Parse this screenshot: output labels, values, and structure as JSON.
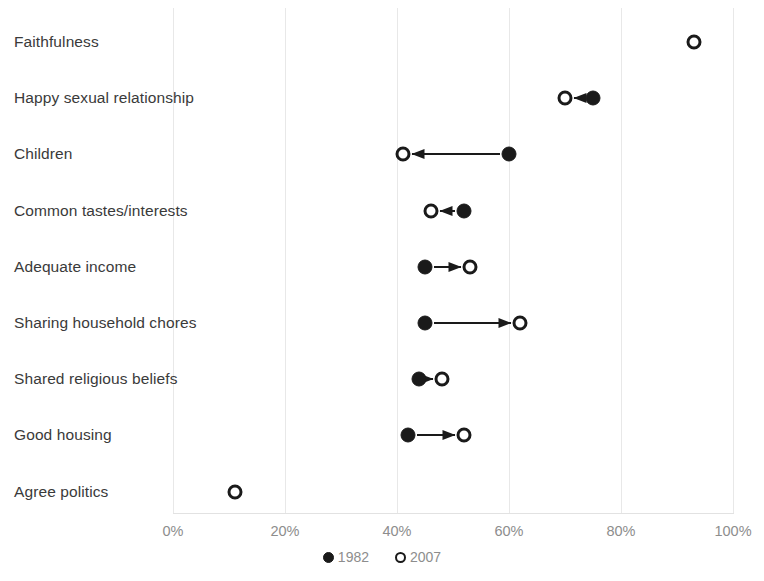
{
  "chart_data": {
    "type": "scatter",
    "title": "",
    "subtitle": "",
    "xlabel": "",
    "ylabel": "",
    "xlim": [
      0,
      100
    ],
    "grid": true,
    "grid_axis": "x",
    "legend_position": "bottom-center",
    "tick_labels": [
      "0%",
      "20%",
      "40%",
      "60%",
      "80%",
      "100%"
    ],
    "tick_values": [
      0,
      20,
      40,
      60,
      80,
      100
    ],
    "legend": [
      {
        "name": "1982",
        "marker": "filled-circle"
      },
      {
        "name": "2007",
        "marker": "open-circle"
      }
    ],
    "series": [
      {
        "name": "1982",
        "marker": "filled-circle",
        "values": [
          93,
          75,
          60,
          52,
          45,
          45,
          44,
          42,
          null
        ]
      },
      {
        "name": "2007",
        "marker": "open-circle",
        "values": [
          93,
          70,
          41,
          46,
          53,
          62,
          48,
          52,
          11
        ]
      }
    ],
    "categories": [
      "Faithfulness",
      "Happy sexual relationship",
      "Children",
      "Common tastes/interests",
      "Adequate income",
      "Sharing household chores",
      "Shared religious beliefs",
      "Good housing",
      "Agree politics"
    ],
    "points": [
      {
        "category": "Faithfulness",
        "v1982": 93,
        "v2007": 93,
        "arrow": "none",
        "overlap": true
      },
      {
        "category": "Happy sexual relationship",
        "v1982": 75,
        "v2007": 70,
        "arrow": "left",
        "overlap": false
      },
      {
        "category": "Children",
        "v1982": 60,
        "v2007": 41,
        "arrow": "left",
        "overlap": false
      },
      {
        "category": "Common tastes/interests",
        "v1982": 52,
        "v2007": 46,
        "arrow": "left",
        "overlap": false
      },
      {
        "category": "Adequate income",
        "v1982": 45,
        "v2007": 53,
        "arrow": "right",
        "overlap": false
      },
      {
        "category": "Sharing household chores",
        "v1982": 45,
        "v2007": 62,
        "arrow": "right",
        "overlap": false
      },
      {
        "category": "Shared religious beliefs",
        "v1982": 44,
        "v2007": 48,
        "arrow": "right",
        "overlap": false
      },
      {
        "category": "Good housing",
        "v1982": 42,
        "v2007": 52,
        "arrow": "right",
        "overlap": false
      },
      {
        "category": "Agree politics",
        "v1982": null,
        "v2007": 11,
        "arrow": "none",
        "overlap": false
      }
    ],
    "colors": {
      "marker": "#1a1a1a",
      "gridline": "#e8e8e8",
      "label_text": "#3a3a3a",
      "tick_text": "#8d8d8d",
      "background": "#ffffff"
    }
  }
}
